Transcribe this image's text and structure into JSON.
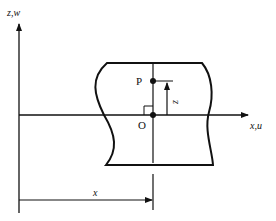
{
  "diagram": {
    "type": "beam-cross-section coordinate diagram",
    "axes": {
      "vertical_label": "z,w",
      "horizontal_label": "x,u"
    },
    "points": [
      {
        "id": "P",
        "label": "P"
      },
      {
        "id": "O",
        "label": "O"
      }
    ],
    "dimensions": {
      "vertical_offset_label": "z",
      "horizontal_distance_label": "x"
    },
    "colors": {
      "stroke": "#111111",
      "background": "#ffffff"
    }
  }
}
